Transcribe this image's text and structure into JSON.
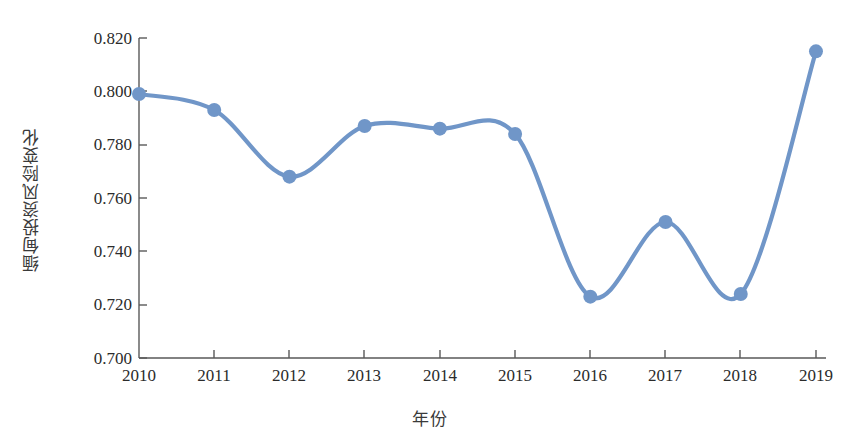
{
  "chart_data": {
    "type": "line",
    "title": "",
    "subtitle": "",
    "xlabel": "年份",
    "ylabel": "缅甸投资风险变化",
    "categories": [
      "2010",
      "2011",
      "2012",
      "2013",
      "2014",
      "2015",
      "2016",
      "2017",
      "2018",
      "2019"
    ],
    "x": [
      2010,
      2011,
      2012,
      2013,
      2014,
      2015,
      2016,
      2017,
      2018,
      2019
    ],
    "values": [
      0.799,
      0.793,
      0.768,
      0.787,
      0.786,
      0.784,
      0.723,
      0.751,
      0.724,
      0.815
    ],
    "series": [
      {
        "name": "缅甸投资风险变化",
        "values": [
          0.799,
          0.793,
          0.768,
          0.787,
          0.786,
          0.784,
          0.723,
          0.751,
          0.724,
          0.815
        ]
      }
    ],
    "ylim": [
      0.7,
      0.82
    ],
    "ytick_labels": [
      "0.820",
      "0.800",
      "0.780",
      "0.760",
      "0.740",
      "0.720",
      "0.700"
    ],
    "ytick_values": [
      0.82,
      0.8,
      0.78,
      0.76,
      0.74,
      0.72,
      0.7
    ],
    "xtick_labels": [
      "2010",
      "2011",
      "2012",
      "2013",
      "2014",
      "2015",
      "2016",
      "2017",
      "2018",
      "2019"
    ],
    "grid": false,
    "legend": false,
    "legend_position": "none",
    "smooth": true,
    "markers": true,
    "line_color": "#7096c8",
    "marker_color": "#7096c8",
    "axis_color": "#595959"
  }
}
